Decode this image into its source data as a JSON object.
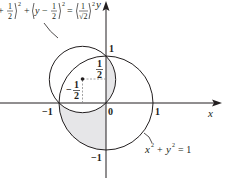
{
  "diagram": {
    "colors": {
      "stroke": "#231f20",
      "shade": "#e6e6e8",
      "dash": "#8a8a8a"
    },
    "axes": {
      "x_label": "x",
      "y_label": "y"
    },
    "ticks": {
      "x_neg_one": "−1",
      "x_zero": "0",
      "x_one": "1",
      "y_one": "1",
      "y_neg_one": "−1"
    },
    "small_circle": {
      "equation_visible": "+ 1/2)² + (y − 1/2)² = (1/√2)²",
      "eq_part1": "+",
      "eq_frac1_num": "1",
      "eq_frac1_den": "2",
      "eq_sup1": "2",
      "eq_plus": "+",
      "eq_y": "y",
      "eq_minus": "−",
      "eq_frac2_num": "1",
      "eq_frac2_den": "2",
      "eq_sup2": "2",
      "eq_equals": "=",
      "eq_frac3_num": "1",
      "eq_frac3_den": "√2",
      "eq_sup3": "2",
      "center": [
        -0.5,
        0.5
      ],
      "radius": "1/√2"
    },
    "center_labels": {
      "y_half_num": "1",
      "y_half_den": "2",
      "x_half_sign": "−",
      "x_half_num": "1",
      "x_half_den": "2"
    },
    "unit_circle": {
      "eq_x": "x",
      "eq_sup_x": "2",
      "eq_plus": "+",
      "eq_y": "y",
      "eq_sup_y": "2",
      "eq_rest": "= 1",
      "center": [
        0,
        0
      ],
      "radius": 1
    }
  }
}
